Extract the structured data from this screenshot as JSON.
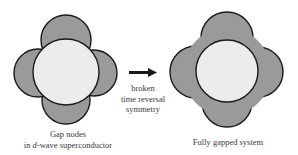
{
  "colors": {
    "lobe_fill": "#9a9a9a",
    "inner_fill": "#ececec",
    "stroke": "#1a1a1a",
    "text": "#3a3a3a"
  },
  "left_panel": {
    "caption_line1": "Gap nodes",
    "caption_line2_prefix": "in ",
    "caption_line2_italic": "d",
    "caption_line2_suffix": "-wave superconductor",
    "shape": "d-wave gap with nodes"
  },
  "transition": {
    "arrow": "right-arrow",
    "line1": "broken",
    "line2": "time reversal",
    "line3": "symmetry"
  },
  "right_panel": {
    "caption": "Fully gapped system",
    "shape": "fully gapped (no nodes)"
  }
}
